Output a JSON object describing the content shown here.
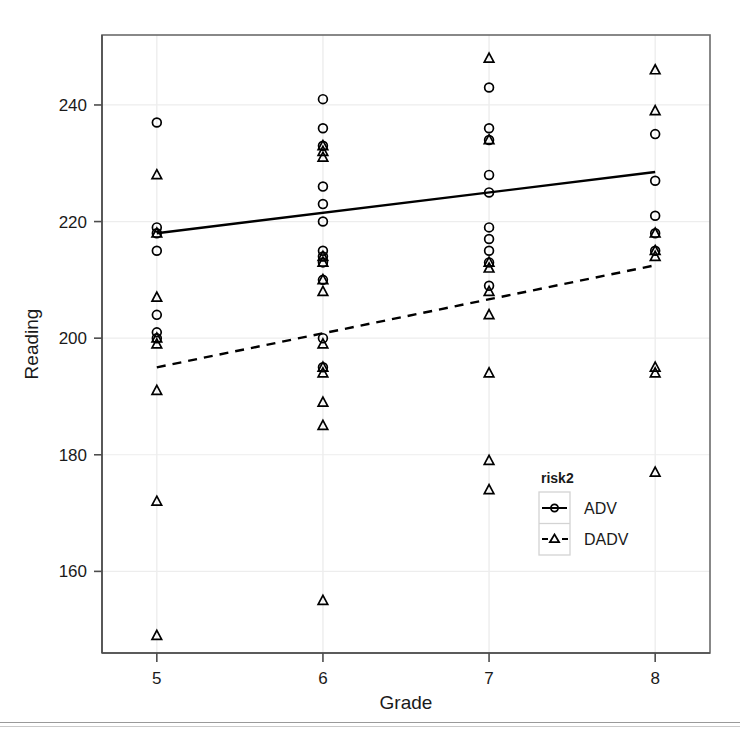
{
  "chart_data": {
    "type": "scatter",
    "title": "",
    "xlabel": "Grade",
    "ylabel": "Reading",
    "xlim": [
      4.67,
      8.33
    ],
    "ylim": [
      146,
      252
    ],
    "xticks": [
      5,
      6,
      7,
      8
    ],
    "xtick_labels": [
      "5",
      "6",
      "7",
      "8"
    ],
    "yticks": [
      160,
      180,
      200,
      220,
      240
    ],
    "ytick_labels": [
      "160",
      "180",
      "200",
      "220",
      "240"
    ],
    "grid": "light-reference-lines",
    "legend": {
      "title": "risk2",
      "position": "inside-lower-right",
      "entries": [
        {
          "label": "ADV",
          "marker": "circle",
          "line": "solid"
        },
        {
          "label": "DADV",
          "marker": "triangle",
          "line": "dashed"
        }
      ]
    },
    "series": [
      {
        "name": "ADV",
        "marker": "circle",
        "line_style": "solid",
        "fit_line": {
          "x": [
            5,
            8
          ],
          "y": [
            218.0,
            228.5
          ]
        },
        "points": [
          {
            "x": 5,
            "y": 237
          },
          {
            "x": 5,
            "y": 219
          },
          {
            "x": 5,
            "y": 218
          },
          {
            "x": 5,
            "y": 215
          },
          {
            "x": 5,
            "y": 204
          },
          {
            "x": 5,
            "y": 201
          },
          {
            "x": 5,
            "y": 200
          },
          {
            "x": 6,
            "y": 241
          },
          {
            "x": 6,
            "y": 236
          },
          {
            "x": 6,
            "y": 233
          },
          {
            "x": 6,
            "y": 226
          },
          {
            "x": 6,
            "y": 223
          },
          {
            "x": 6,
            "y": 220
          },
          {
            "x": 6,
            "y": 215
          },
          {
            "x": 6,
            "y": 214
          },
          {
            "x": 6,
            "y": 213
          },
          {
            "x": 6,
            "y": 210
          },
          {
            "x": 6,
            "y": 200
          },
          {
            "x": 6,
            "y": 195
          },
          {
            "x": 7,
            "y": 243
          },
          {
            "x": 7,
            "y": 236
          },
          {
            "x": 7,
            "y": 234
          },
          {
            "x": 7,
            "y": 228
          },
          {
            "x": 7,
            "y": 225
          },
          {
            "x": 7,
            "y": 219
          },
          {
            "x": 7,
            "y": 217
          },
          {
            "x": 7,
            "y": 215
          },
          {
            "x": 7,
            "y": 213
          },
          {
            "x": 7,
            "y": 209
          },
          {
            "x": 8,
            "y": 235
          },
          {
            "x": 8,
            "y": 227
          },
          {
            "x": 8,
            "y": 221
          },
          {
            "x": 8,
            "y": 218
          },
          {
            "x": 8,
            "y": 215
          }
        ]
      },
      {
        "name": "DADV",
        "marker": "triangle",
        "line_style": "dashed",
        "fit_line": {
          "x": [
            5,
            8
          ],
          "y": [
            195.0,
            212.5
          ]
        },
        "points": [
          {
            "x": 5,
            "y": 228
          },
          {
            "x": 5,
            "y": 218
          },
          {
            "x": 5,
            "y": 207
          },
          {
            "x": 5,
            "y": 200
          },
          {
            "x": 5,
            "y": 199
          },
          {
            "x": 5,
            "y": 191
          },
          {
            "x": 5,
            "y": 172
          },
          {
            "x": 5,
            "y": 149
          },
          {
            "x": 6,
            "y": 233
          },
          {
            "x": 6,
            "y": 232
          },
          {
            "x": 6,
            "y": 231
          },
          {
            "x": 6,
            "y": 214
          },
          {
            "x": 6,
            "y": 213
          },
          {
            "x": 6,
            "y": 210
          },
          {
            "x": 6,
            "y": 208
          },
          {
            "x": 6,
            "y": 199
          },
          {
            "x": 6,
            "y": 195
          },
          {
            "x": 6,
            "y": 194
          },
          {
            "x": 6,
            "y": 189
          },
          {
            "x": 6,
            "y": 185
          },
          {
            "x": 6,
            "y": 155
          },
          {
            "x": 7,
            "y": 248
          },
          {
            "x": 7,
            "y": 234
          },
          {
            "x": 7,
            "y": 213
          },
          {
            "x": 7,
            "y": 212
          },
          {
            "x": 7,
            "y": 208
          },
          {
            "x": 7,
            "y": 204
          },
          {
            "x": 7,
            "y": 194
          },
          {
            "x": 7,
            "y": 179
          },
          {
            "x": 7,
            "y": 174
          },
          {
            "x": 8,
            "y": 246
          },
          {
            "x": 8,
            "y": 239
          },
          {
            "x": 8,
            "y": 218
          },
          {
            "x": 8,
            "y": 215
          },
          {
            "x": 8,
            "y": 214
          },
          {
            "x": 8,
            "y": 195
          },
          {
            "x": 8,
            "y": 194
          },
          {
            "x": 8,
            "y": 177
          }
        ]
      }
    ]
  },
  "colors": {
    "axis": "#4d4d4d",
    "marker": "#000000",
    "frame": "#6b6b6b",
    "gridline": "#ededed",
    "text": "#1a1a1a"
  }
}
